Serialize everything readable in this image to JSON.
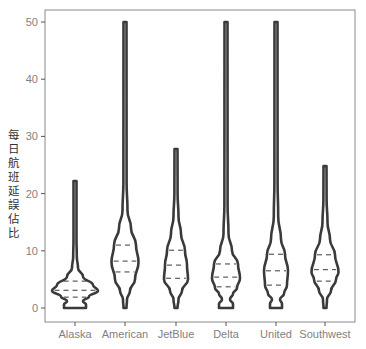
{
  "chart_data": {
    "type": "violin",
    "title": "",
    "xlabel": "",
    "ylabel": "每日航班延誤佔比",
    "ylim": [
      0,
      50
    ],
    "yticks": [
      0,
      10,
      20,
      30,
      40,
      50
    ],
    "grid": false,
    "legend": null,
    "categories": [
      "Alaska",
      "American",
      "JetBlue",
      "Delta",
      "United",
      "Southwest"
    ],
    "series": [
      {
        "name": "Alaska",
        "min": 0,
        "max": 22.2,
        "q1": 1.9,
        "median": 3.1,
        "q3": 4.7,
        "mode": 3.0
      },
      {
        "name": "American",
        "min": 0,
        "max": 50,
        "q1": 6.3,
        "median": 8.2,
        "q3": 11.0,
        "mode": 8.0
      },
      {
        "name": "JetBlue",
        "min": 0,
        "max": 27.8,
        "q1": 5.2,
        "median": 7.5,
        "q3": 10.1,
        "mode": 5.0
      },
      {
        "name": "Delta",
        "min": 0,
        "max": 50,
        "q1": 3.7,
        "median": 5.4,
        "q3": 7.7,
        "mode": 5.2
      },
      {
        "name": "United",
        "min": 0,
        "max": 50,
        "q1": 4.0,
        "median": 6.5,
        "q3": 9.4,
        "mode": 6.5
      },
      {
        "name": "Southwest",
        "min": 0,
        "max": 24.8,
        "q1": 4.7,
        "median": 6.7,
        "q3": 9.3,
        "mode": 6.3
      }
    ],
    "draw_quantiles": [
      0.25,
      0.5,
      0.75
    ]
  },
  "colors": {
    "outline": "#3a3a3a",
    "frame": "#555555",
    "tick_text": "#7f7f7f"
  }
}
